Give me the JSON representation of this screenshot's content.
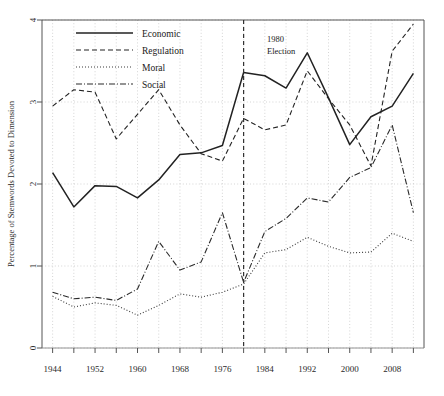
{
  "chart_data": {
    "type": "line",
    "title": "",
    "xlabel": "",
    "ylabel": "Percentage of Stemwords Devoted to Dimension",
    "xlim": [
      1942,
      2014
    ],
    "ylim": [
      0,
      4
    ],
    "xticks": [
      1944,
      1948,
      1952,
      1956,
      1960,
      1964,
      1968,
      1972,
      1976,
      1980,
      1984,
      1988,
      1992,
      1996,
      2000,
      2004,
      2008,
      2012
    ],
    "xtick_labels_shown": [
      "1944",
      "1952",
      "1960",
      "1968",
      "1976",
      "1984",
      "1992",
      "2000",
      "2008"
    ],
    "xtick_labels_shown_values": [
      1944,
      1952,
      1960,
      1968,
      1976,
      1984,
      1992,
      2000,
      2008
    ],
    "yticks": [
      0,
      1,
      2,
      3,
      4
    ],
    "ytick_labels": [
      "0",
      "1",
      "2",
      "3",
      "4"
    ],
    "grid": true,
    "grid_style": "dotted",
    "legend_position": "top-center",
    "x": [
      1944,
      1948,
      1952,
      1956,
      1960,
      1964,
      1968,
      1972,
      1976,
      1980,
      1984,
      1988,
      1992,
      1996,
      2000,
      2004,
      2008,
      2012
    ],
    "series": [
      {
        "name": "Economic",
        "style": "solid",
        "color": "#222222",
        "values": [
          2.14,
          1.72,
          1.98,
          1.97,
          1.83,
          2.05,
          2.36,
          2.38,
          2.47,
          3.36,
          3.32,
          3.17,
          3.6,
          3.05,
          2.48,
          2.82,
          2.95,
          3.35
        ]
      },
      {
        "name": "Regulation",
        "style": "dashed",
        "color": "#222222",
        "values": [
          2.95,
          3.15,
          3.12,
          2.55,
          2.85,
          3.15,
          2.72,
          2.37,
          2.28,
          2.8,
          2.66,
          2.72,
          3.38,
          3.04,
          2.72,
          2.22,
          3.62,
          3.95
        ]
      },
      {
        "name": "Moral",
        "style": "dotted",
        "color": "#3a3a3a",
        "values": [
          0.63,
          0.5,
          0.55,
          0.52,
          0.4,
          0.52,
          0.66,
          0.62,
          0.68,
          0.78,
          1.16,
          1.2,
          1.35,
          1.24,
          1.16,
          1.17,
          1.4,
          1.3
        ]
      },
      {
        "name": "Social",
        "style": "dashdot",
        "color": "#2a2a2a",
        "values": [
          0.68,
          0.6,
          0.62,
          0.58,
          0.72,
          1.3,
          0.95,
          1.05,
          1.65,
          0.8,
          1.42,
          1.58,
          1.83,
          1.78,
          2.08,
          2.2,
          2.72,
          1.65
        ]
      }
    ],
    "annotations": [
      {
        "name": "election-marker",
        "lines": [
          "1980",
          "Election"
        ],
        "x": 1980,
        "style": "vertical-dashed-line"
      }
    ]
  },
  "legend": {
    "items": [
      {
        "label": "Economic",
        "style": "solid"
      },
      {
        "label": "Regulation",
        "style": "dashed"
      },
      {
        "label": "Moral",
        "style": "dotted"
      },
      {
        "label": "Social",
        "style": "dashdot"
      }
    ]
  },
  "axes": {
    "y_title": "Percentage of Stemwords Devoted to Dimension"
  }
}
